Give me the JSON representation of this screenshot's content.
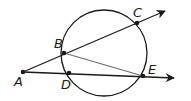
{
  "diagram": {
    "type": "geometry",
    "colors": {
      "stroke": "#1a1a1a",
      "chord": "#6b6b6b",
      "background": "#ffffff"
    },
    "circle": {
      "cx": 104,
      "cy": 53,
      "r": 43
    },
    "points": {
      "A": {
        "label": "A",
        "x": 23,
        "y": 72
      },
      "B": {
        "label": "B",
        "x": 64,
        "y": 53
      },
      "C": {
        "label": "C",
        "x": 137,
        "y": 23
      },
      "D": {
        "label": "D",
        "x": 69,
        "y": 73
      },
      "E": {
        "label": "E",
        "x": 143,
        "y": 76
      }
    },
    "rays": [
      {
        "from": "A",
        "through": [
          "B",
          "C"
        ],
        "end": {
          "x": 165,
          "y": 11
        }
      },
      {
        "from": "A",
        "through": [
          "D",
          "E"
        ],
        "end": {
          "x": 174,
          "y": 78
        }
      }
    ],
    "segments": [
      {
        "from": "B",
        "to": "E"
      }
    ]
  }
}
